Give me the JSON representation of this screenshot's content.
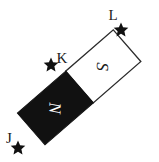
{
  "figure": {
    "kind": "bar-magnet-diagram",
    "width": 159,
    "height": 162,
    "background_color": "#ffffff"
  },
  "magnet": {
    "rotation_degrees": -41,
    "north_pole": {
      "label": "N",
      "fill_color": "#111111",
      "text_color": "#ffffff"
    },
    "south_pole": {
      "label": "S",
      "fill_color": "#ffffff",
      "text_color": "#1a1a1a",
      "outline_color": "#2b2b2b"
    }
  },
  "points": [
    {
      "id": "J",
      "label": "J",
      "marker": "star-marker",
      "x": 18,
      "y": 147
    },
    {
      "id": "K",
      "label": "K",
      "marker": "star-marker",
      "x": 51,
      "y": 64
    },
    {
      "id": "L",
      "label": "L",
      "marker": "star-marker",
      "x": 121,
      "y": 29
    }
  ],
  "labels": {
    "j": "J",
    "k": "K",
    "l": "L",
    "n": "N",
    "s": "S"
  }
}
